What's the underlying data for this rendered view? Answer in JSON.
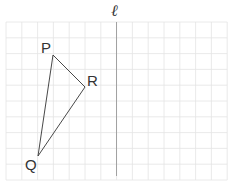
{
  "diagram": {
    "type": "grid-reflection",
    "line_label": "ℓ",
    "grid": {
      "left": 6,
      "top": 22,
      "cell": 15.8,
      "cols": 14,
      "rows": 10,
      "line_color": "#e4e4e4"
    },
    "mirror_line": {
      "x": 116.5,
      "y1": 22,
      "y2": 176,
      "color": "#9a9a9a"
    },
    "triangle": {
      "color": "#333333",
      "vertices": [
        {
          "name": "P",
          "x": 53,
          "y": 55,
          "label_x": 41,
          "label_y": 53
        },
        {
          "name": "R",
          "x": 85,
          "y": 87,
          "label_x": 87,
          "label_y": 86
        },
        {
          "name": "Q",
          "x": 38,
          "y": 156,
          "label_x": 25,
          "label_y": 170
        }
      ]
    }
  }
}
